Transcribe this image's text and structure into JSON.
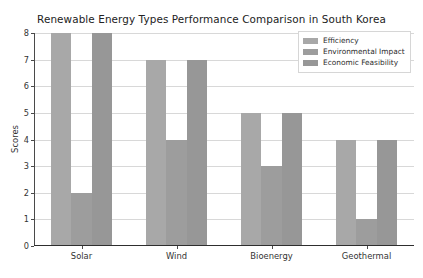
{
  "chart_data": {
    "type": "bar",
    "title": "Renewable Energy Types Performance Comparison in South Korea",
    "xlabel": "",
    "ylabel": "Scores",
    "categories": [
      "Solar",
      "Wind",
      "Bioenergy",
      "Geothermal"
    ],
    "series": [
      {
        "name": "Efficiency",
        "values": [
          8,
          7,
          5,
          4
        ],
        "color": "#a8a8a8"
      },
      {
        "name": "Environmental Impact",
        "values": [
          2,
          4,
          3,
          1
        ],
        "color": "#9d9d9d"
      },
      {
        "name": "Economic Feasibility",
        "values": [
          8,
          7,
          5,
          4
        ],
        "color": "#979797"
      }
    ],
    "ylim": [
      0,
      8
    ],
    "yticks": [
      0,
      1,
      2,
      3,
      4,
      5,
      6,
      7,
      8
    ],
    "ytick_labels": [
      "0",
      "1",
      "2",
      "3",
      "4",
      "5",
      "6",
      "7",
      "8"
    ],
    "grid": true,
    "grid_axis": "y",
    "legend_position": "upper right",
    "bar_group_gap": 0.35
  },
  "style": {
    "background": "#ffffff",
    "grid_color": "#d8d8d8",
    "axis_color": "#4a4a4a",
    "text_color": "#333333",
    "legend_border": "#d6d6d6"
  }
}
